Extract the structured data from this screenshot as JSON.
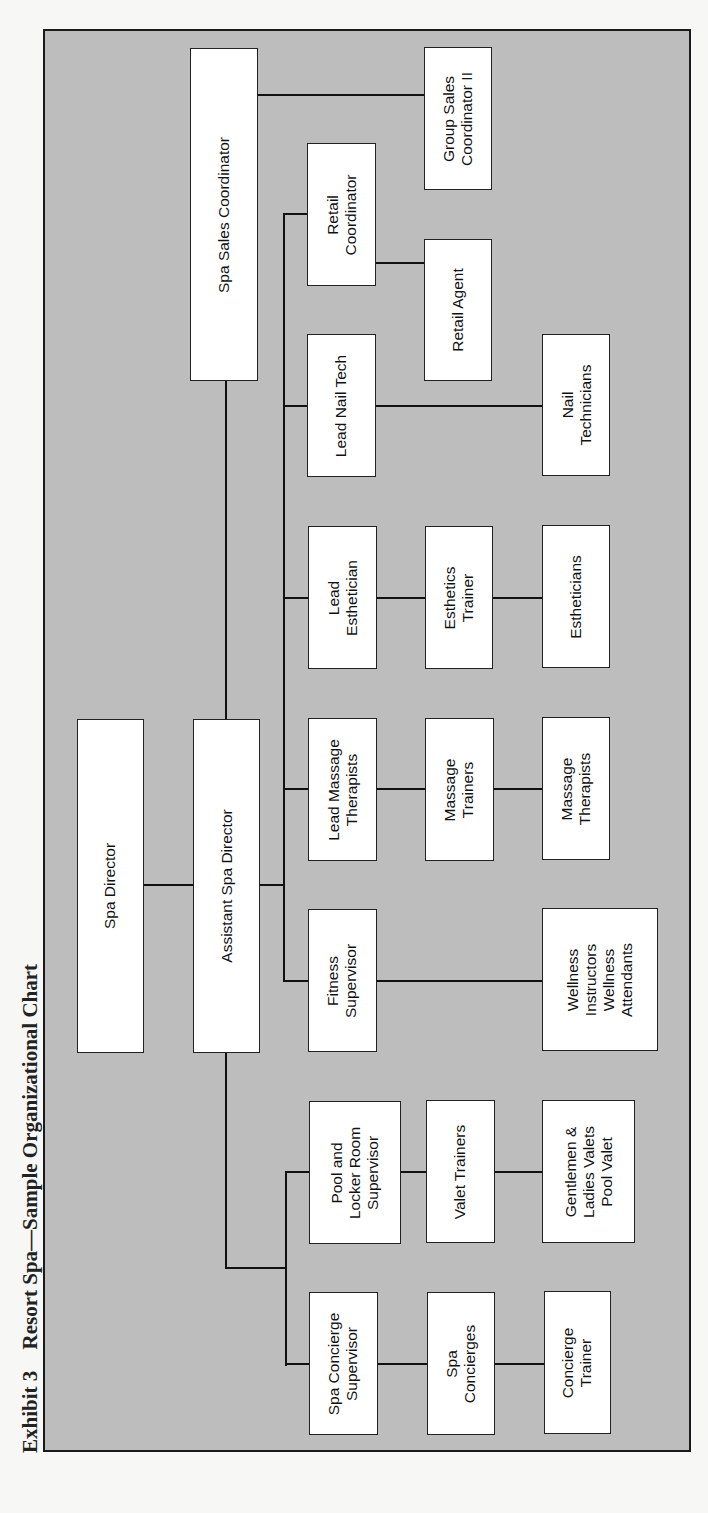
{
  "caption": {
    "exhibit": "Exhibit 3",
    "title": "Resort Spa—Sample Organizational Chart"
  },
  "colors": {
    "background": "#bdbdbd",
    "box_fill": "#ffffff",
    "line": "#111111"
  },
  "nodes": {
    "spa_director": "Spa Director",
    "assistant_spa_director": "Assistant Spa Director",
    "spa_sales_coordinator": "Spa Sales Coordinator",
    "group_sales_coordinator_ii": "Group Sales\nCoordinator II",
    "retail_coordinator": "Retail\nCoordinator",
    "retail_agent": "Retail Agent",
    "lead_nail_tech": "Lead Nail Tech",
    "nail_technicians": "Nail\nTechnicians",
    "lead_esthetician": "Lead\nEsthetician",
    "esthetics_trainer": "Esthetics\nTrainer",
    "estheticians": "Estheticians",
    "lead_massage_therapists": "Lead Massage\nTherapists",
    "massage_trainers": "Massage\nTrainers",
    "massage_therapists": "Massage\nTherapists",
    "fitness_supervisor": "Fitness\nSupervisor",
    "wellness": "Wellness\nInstructors\nWellness\nAttendants",
    "pool_locker_supervisor": "Pool and\nLocker Room\nSupervisor",
    "valet_trainers": "Valet Trainers",
    "valets": "Gentlemen &\nLadies Valets\nPool Valet",
    "spa_concierge_supervisor": "Spa Concierge\nSupervisor",
    "spa_concierges": "Spa\nConcierges",
    "concierge_trainer": "Concierge\nTrainer"
  },
  "hierarchy": [
    {
      "name": "Spa Director",
      "reports": [
        {
          "name": "Assistant Spa Director",
          "reports": [
            {
              "name": "Spa Sales Coordinator",
              "reports": [
                {
                  "name": "Group Sales Coordinator II"
                }
              ]
            },
            {
              "name": "Retail Coordinator",
              "reports": [
                {
                  "name": "Retail Agent"
                }
              ]
            },
            {
              "name": "Lead Nail Tech",
              "reports": [
                {
                  "name": "Nail Technicians"
                }
              ]
            },
            {
              "name": "Lead Esthetician",
              "reports": [
                {
                  "name": "Esthetics Trainer",
                  "reports": [
                    {
                      "name": "Estheticians"
                    }
                  ]
                }
              ]
            },
            {
              "name": "Lead Massage Therapists",
              "reports": [
                {
                  "name": "Massage Trainers",
                  "reports": [
                    {
                      "name": "Massage Therapists"
                    }
                  ]
                }
              ]
            },
            {
              "name": "Fitness Supervisor",
              "reports": [
                {
                  "name": "Wellness Instructors / Wellness Attendants"
                }
              ]
            },
            {
              "name": "Pool and Locker Room Supervisor",
              "reports": [
                {
                  "name": "Valet Trainers",
                  "reports": [
                    {
                      "name": "Gentlemen & Ladies Valets / Pool Valet"
                    }
                  ]
                }
              ]
            },
            {
              "name": "Spa Concierge Supervisor",
              "reports": [
                {
                  "name": "Spa Concierges",
                  "reports": [
                    {
                      "name": "Concierge Trainer"
                    }
                  ]
                }
              ]
            }
          ]
        }
      ]
    }
  ]
}
